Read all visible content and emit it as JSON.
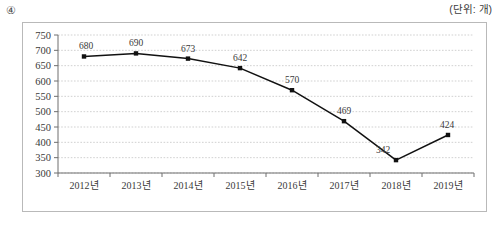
{
  "header": {
    "item_number": "④",
    "unit_label": "(단위: 개)"
  },
  "chart_data": {
    "type": "line",
    "title": "",
    "xlabel": "",
    "ylabel": "",
    "unit": "개",
    "categories": [
      "2012년",
      "2013년",
      "2014년",
      "2015년",
      "2016년",
      "2017년",
      "2018년",
      "2019년"
    ],
    "values": [
      680,
      690,
      673,
      642,
      570,
      469,
      342,
      424
    ],
    "point_labels": [
      "680",
      "690",
      "673",
      "642",
      "570",
      "469",
      "342",
      "424"
    ],
    "ylim": [
      300,
      750
    ],
    "ytick_step": 50,
    "ytick_labels": [
      "750",
      "700",
      "650",
      "600",
      "550",
      "500",
      "450",
      "400",
      "350",
      "300"
    ],
    "ytick_values": [
      750,
      700,
      650,
      600,
      550,
      500,
      450,
      400,
      350,
      300
    ],
    "grid": true,
    "grid_style": "dotted",
    "legend": false,
    "legend_position": "none",
    "line_color": "#111111",
    "marker_color": "#111111",
    "grid_color": "#bdbdbd",
    "axis_color": "#6e6e6e"
  }
}
